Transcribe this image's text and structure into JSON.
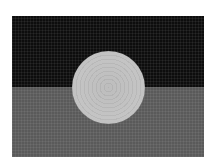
{
  "image": {
    "description": "Grayscale mosaic-style flag: black upper band, gray lower band, light circular disc centered on the dividing line",
    "colors": {
      "background": "#ffffff",
      "top_band": "#0d0d0d",
      "bottom_band": "#5a5a5a",
      "disc": "#c0c0c0"
    }
  }
}
